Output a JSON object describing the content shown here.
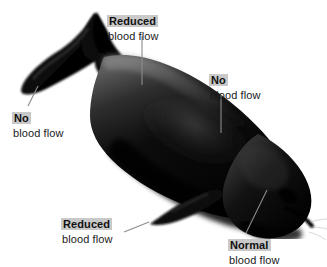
{
  "figure": {
    "background_color": "#ffffff",
    "body_color": "#000000",
    "leader_line_color": "#8a8a8a",
    "highlight_color": "#c9c9c9"
  },
  "labels": [
    {
      "id": "reduced-top",
      "title": "Reduced",
      "subtitle": "blood flow",
      "points_to": "dorsal-back-muscle",
      "leader": "vertical"
    },
    {
      "id": "no-tail",
      "title": "No",
      "subtitle": "blood flow",
      "points_to": "tail-fluke",
      "leader": "diagonal"
    },
    {
      "id": "no-right",
      "title": "No",
      "subtitle": "blood flow",
      "points_to": "mid-body-skin",
      "leader": "vertical"
    },
    {
      "id": "reduced-bottom",
      "title": "Reduced",
      "subtitle": "blood flow",
      "points_to": "pectoral-flipper",
      "leader": "diagonal"
    },
    {
      "id": "normal",
      "title": "Normal",
      "subtitle": "blood flow",
      "points_to": "head-brain",
      "leader": "diagonal"
    }
  ],
  "anatomy": {
    "tail_fluke": "tail-fluke",
    "dorsal_fin": "dorsal-fin",
    "body": "whale-body",
    "flipper": "pectoral-flipper",
    "head": "whale-head"
  }
}
